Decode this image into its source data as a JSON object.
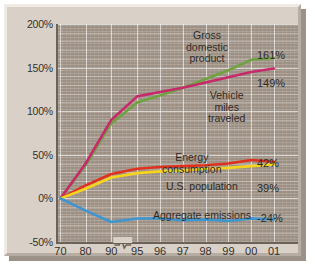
{
  "chart_data": {
    "type": "line",
    "title": "",
    "subtitle": "",
    "xlabel": "",
    "ylabel": "",
    "grid": true,
    "legend_position": "inline-annotations",
    "x_tick_labels": [
      "70",
      "80",
      "90",
      "95",
      "96",
      "97",
      "98",
      "99",
      "00",
      "01"
    ],
    "x_axis_break_between": [
      "90",
      "95"
    ],
    "y_tick_labels": [
      "200%",
      "150%",
      "100%",
      "50%",
      "0%",
      "-50%"
    ],
    "y_tick_values": [
      200,
      150,
      100,
      50,
      0,
      -50
    ],
    "ylim": [
      -50,
      200
    ],
    "series": [
      {
        "name": "Gross domestic product",
        "color": "#6fa342",
        "end_value": 161,
        "end_label": "161%",
        "label_text": "Gross\ndomestic\nproduct",
        "x": [
          "70",
          "80",
          "90",
          "95",
          "96",
          "97",
          "98",
          "99",
          "00",
          "01"
        ],
        "values": [
          0,
          38,
          86,
          110,
          118,
          127,
          137,
          147,
          159,
          161
        ]
      },
      {
        "name": "Vehicle miles traveled",
        "color": "#c62a6b",
        "end_value": 149,
        "end_label": "149%",
        "label_text": "Vehicle\nmiles\ntraveled",
        "x": [
          "70",
          "80",
          "90",
          "95",
          "96",
          "97",
          "98",
          "99",
          "00",
          "01"
        ],
        "values": [
          0,
          40,
          90,
          117,
          122,
          127,
          133,
          139,
          145,
          149
        ]
      },
      {
        "name": "Energy consumption",
        "color": "#e0301e",
        "end_value": 42,
        "end_label": "42%",
        "label_text": "Energy\nconsumption",
        "x": [
          "70",
          "80",
          "90",
          "95",
          "96",
          "97",
          "98",
          "99",
          "00",
          "01"
        ],
        "values": [
          0,
          15,
          28,
          34,
          36,
          37,
          38,
          40,
          44,
          42
        ]
      },
      {
        "name": "U.S. population",
        "color": "#f4d41c",
        "end_value": 39,
        "end_label": "39%",
        "label_text": "U.S. population",
        "x": [
          "70",
          "80",
          "90",
          "95",
          "96",
          "97",
          "98",
          "99",
          "00",
          "01"
        ],
        "values": [
          0,
          11,
          24,
          29,
          31,
          32,
          34,
          35,
          37,
          39
        ]
      },
      {
        "name": "Aggregate emissions",
        "color": "#3d95d1",
        "end_value": -24,
        "end_label": "-24%",
        "label_text": "Aggregate emissions",
        "x": [
          "70",
          "80",
          "90",
          "95",
          "96",
          "97",
          "98",
          "99",
          "00",
          "01"
        ],
        "values": [
          0,
          -14,
          -27,
          -23,
          -23,
          -25,
          -24,
          -26,
          -23,
          -24
        ]
      }
    ]
  },
  "annotations": {
    "gdp_label": "Gross\ndomestic\nproduct",
    "vmt_label": "Vehicle\nmiles\ntraveled",
    "energy_label": "Energy\nconsumption",
    "population_label": "U.S. population",
    "emissions_label": "Aggregate emissions",
    "gdp_end": "161%",
    "vmt_end": "149%",
    "energy_end": "42%",
    "population_end": "39%",
    "emissions_end": "-24%"
  },
  "colors": {
    "panel": "#d9d1c7",
    "plot_background": "#a89b8e",
    "axis": "#6d6258",
    "text": "#2e2b27"
  }
}
